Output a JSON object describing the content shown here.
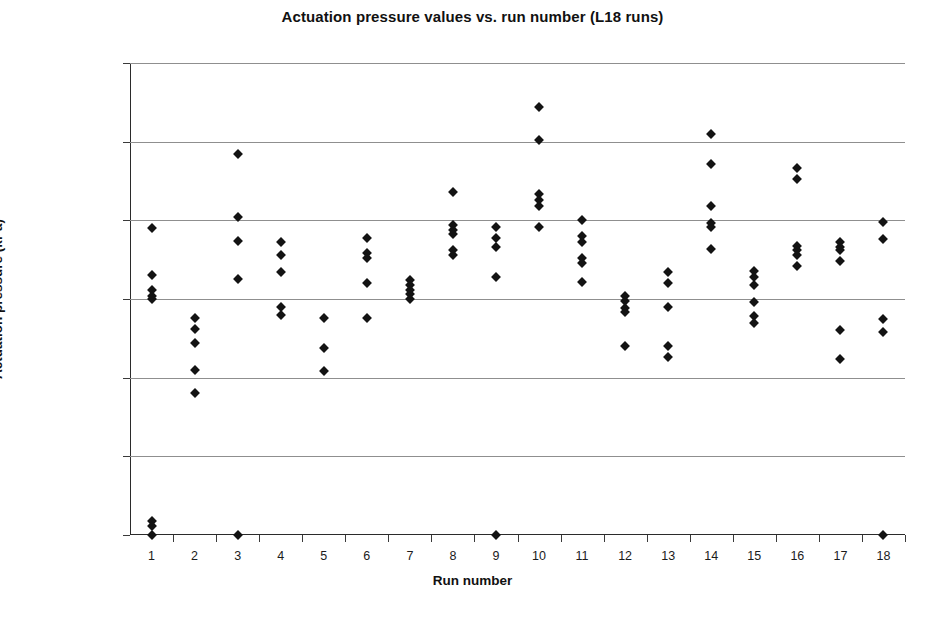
{
  "chart_data": {
    "type": "scatter",
    "title": "Actuation pressure values vs. run number (L18 runs)",
    "xlabel": "Run number",
    "ylabel": "Actuation pressure (kPa)",
    "xlim": [
      0.5,
      18.5
    ],
    "ylim": [
      0,
      300
    ],
    "grid": true,
    "legend": "none",
    "marker": "filled-diamond",
    "marker_color": "#131313",
    "x_tick_labels": [
      "1",
      "2",
      "3",
      "4",
      "5",
      "6",
      "7",
      "8",
      "9",
      "10",
      "11",
      "12",
      "13",
      "14",
      "15",
      "16",
      "17",
      "18"
    ],
    "y_tick_labels": [
      "0.00",
      "50.00",
      "100.00",
      "150.00",
      "200.00",
      "250.00",
      "300.00"
    ],
    "y_ticks": [
      0,
      50,
      100,
      150,
      200,
      250,
      300
    ],
    "x_ticks": [
      1,
      2,
      3,
      4,
      5,
      6,
      7,
      8,
      9,
      10,
      11,
      12,
      13,
      14,
      15,
      16,
      17,
      18
    ],
    "points": [
      {
        "x": 1,
        "y": 195
      },
      {
        "x": 1,
        "y": 165
      },
      {
        "x": 1,
        "y": 156
      },
      {
        "x": 1,
        "y": 152
      },
      {
        "x": 1,
        "y": 150
      },
      {
        "x": 1,
        "y": 9
      },
      {
        "x": 1,
        "y": 6
      },
      {
        "x": 1,
        "y": 0
      },
      {
        "x": 2,
        "y": 138
      },
      {
        "x": 2,
        "y": 131
      },
      {
        "x": 2,
        "y": 122
      },
      {
        "x": 2,
        "y": 105
      },
      {
        "x": 2,
        "y": 90
      },
      {
        "x": 3,
        "y": 242
      },
      {
        "x": 3,
        "y": 202
      },
      {
        "x": 3,
        "y": 187
      },
      {
        "x": 3,
        "y": 163
      },
      {
        "x": 3,
        "y": 0
      },
      {
        "x": 4,
        "y": 186
      },
      {
        "x": 4,
        "y": 178
      },
      {
        "x": 4,
        "y": 167
      },
      {
        "x": 4,
        "y": 145
      },
      {
        "x": 4,
        "y": 140
      },
      {
        "x": 5,
        "y": 138
      },
      {
        "x": 5,
        "y": 119
      },
      {
        "x": 5,
        "y": 104
      },
      {
        "x": 6,
        "y": 189
      },
      {
        "x": 6,
        "y": 179
      },
      {
        "x": 6,
        "y": 176
      },
      {
        "x": 6,
        "y": 160
      },
      {
        "x": 6,
        "y": 138
      },
      {
        "x": 7,
        "y": 162
      },
      {
        "x": 7,
        "y": 159
      },
      {
        "x": 7,
        "y": 156
      },
      {
        "x": 7,
        "y": 153
      },
      {
        "x": 7,
        "y": 150
      },
      {
        "x": 8,
        "y": 218
      },
      {
        "x": 8,
        "y": 197
      },
      {
        "x": 8,
        "y": 194
      },
      {
        "x": 8,
        "y": 191
      },
      {
        "x": 8,
        "y": 181
      },
      {
        "x": 8,
        "y": 178
      },
      {
        "x": 9,
        "y": 196
      },
      {
        "x": 9,
        "y": 189
      },
      {
        "x": 9,
        "y": 183
      },
      {
        "x": 9,
        "y": 164
      },
      {
        "x": 9,
        "y": 0
      },
      {
        "x": 10,
        "y": 272
      },
      {
        "x": 10,
        "y": 251
      },
      {
        "x": 10,
        "y": 217
      },
      {
        "x": 10,
        "y": 213
      },
      {
        "x": 10,
        "y": 209
      },
      {
        "x": 10,
        "y": 196
      },
      {
        "x": 11,
        "y": 200
      },
      {
        "x": 11,
        "y": 190
      },
      {
        "x": 11,
        "y": 186
      },
      {
        "x": 11,
        "y": 176
      },
      {
        "x": 11,
        "y": 173
      },
      {
        "x": 11,
        "y": 161
      },
      {
        "x": 12,
        "y": 152
      },
      {
        "x": 12,
        "y": 149
      },
      {
        "x": 12,
        "y": 144
      },
      {
        "x": 12,
        "y": 142
      },
      {
        "x": 12,
        "y": 120
      },
      {
        "x": 13,
        "y": 167
      },
      {
        "x": 13,
        "y": 160
      },
      {
        "x": 13,
        "y": 145
      },
      {
        "x": 13,
        "y": 120
      },
      {
        "x": 13,
        "y": 113
      },
      {
        "x": 14,
        "y": 255
      },
      {
        "x": 14,
        "y": 236
      },
      {
        "x": 14,
        "y": 209
      },
      {
        "x": 14,
        "y": 198
      },
      {
        "x": 14,
        "y": 196
      },
      {
        "x": 14,
        "y": 182
      },
      {
        "x": 15,
        "y": 168
      },
      {
        "x": 15,
        "y": 164
      },
      {
        "x": 15,
        "y": 159
      },
      {
        "x": 15,
        "y": 148
      },
      {
        "x": 15,
        "y": 139
      },
      {
        "x": 15,
        "y": 135
      },
      {
        "x": 16,
        "y": 233
      },
      {
        "x": 16,
        "y": 226
      },
      {
        "x": 16,
        "y": 184
      },
      {
        "x": 16,
        "y": 181
      },
      {
        "x": 16,
        "y": 178
      },
      {
        "x": 16,
        "y": 171
      },
      {
        "x": 17,
        "y": 186
      },
      {
        "x": 17,
        "y": 183
      },
      {
        "x": 17,
        "y": 181
      },
      {
        "x": 17,
        "y": 174
      },
      {
        "x": 17,
        "y": 130
      },
      {
        "x": 17,
        "y": 112
      },
      {
        "x": 18,
        "y": 199
      },
      {
        "x": 18,
        "y": 188
      },
      {
        "x": 18,
        "y": 137
      },
      {
        "x": 18,
        "y": 129
      },
      {
        "x": 18,
        "y": 0
      }
    ]
  }
}
